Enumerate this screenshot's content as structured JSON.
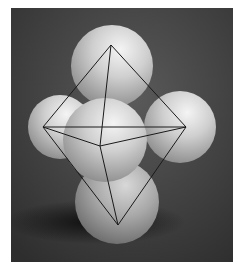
{
  "image": {
    "subject": "balloons arranged in octahedral geometry with wireframe octahedron overlay",
    "background_color": "#3a3a3a",
    "frame": {
      "x": 11,
      "y": 8,
      "width": 222,
      "height": 254
    }
  },
  "spheres": [
    {
      "name": "top",
      "cx": 112,
      "cy": 66,
      "r": 41
    },
    {
      "name": "left",
      "cx": 60,
      "cy": 127,
      "r": 32
    },
    {
      "name": "right",
      "cx": 180,
      "cy": 127,
      "r": 36
    },
    {
      "name": "bottom",
      "cx": 117,
      "cy": 202,
      "r": 42
    },
    {
      "name": "front",
      "cx": 105,
      "cy": 140,
      "r": 42
    }
  ],
  "octahedron": {
    "line_color": "#1a1a1a",
    "vertices": {
      "top": [
        111,
        45
      ],
      "left": [
        43,
        127
      ],
      "right": [
        186,
        127
      ],
      "front": [
        100,
        146
      ],
      "bottom": [
        118,
        225
      ]
    },
    "edges": [
      [
        "top",
        "left"
      ],
      [
        "top",
        "right"
      ],
      [
        "top",
        "front"
      ],
      [
        "left",
        "right"
      ],
      [
        "left",
        "front"
      ],
      [
        "front",
        "right"
      ],
      [
        "left",
        "bottom"
      ],
      [
        "right",
        "bottom"
      ],
      [
        "front",
        "bottom"
      ]
    ]
  }
}
